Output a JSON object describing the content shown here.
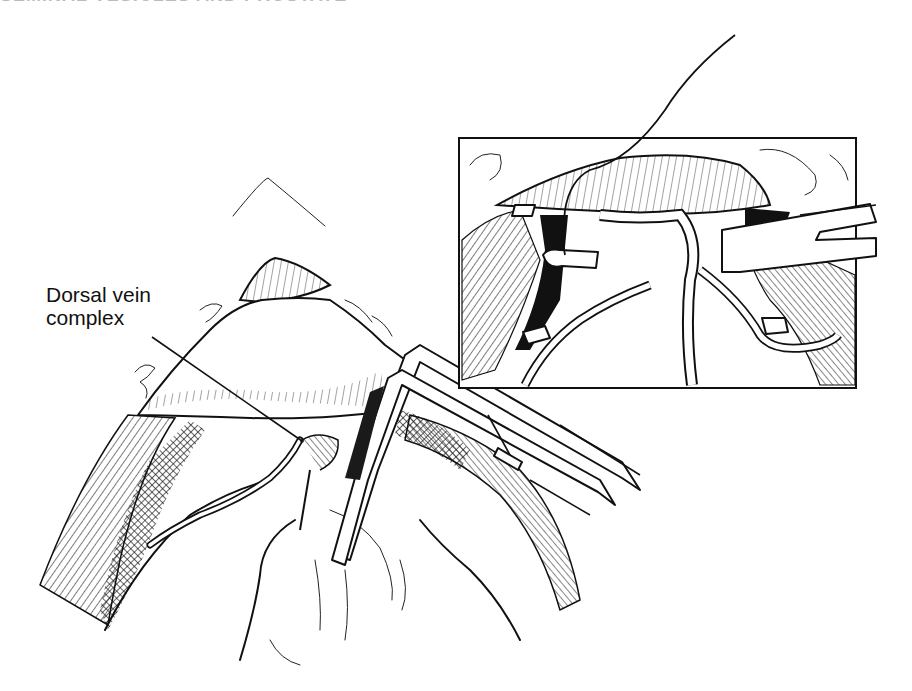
{
  "header": {
    "text_fragment": "SEMINAL VESICLES AND PROSTATE"
  },
  "figure": {
    "labels": [
      {
        "id": "dorsal-vein-complex",
        "line1": "Dorsal vein",
        "line2": "complex"
      }
    ],
    "inset": {
      "present": true,
      "description": "Close-up of ligature passed around dorsal vein complex with clamp"
    },
    "colors": {
      "ink": "#111111",
      "background": "#ffffff"
    }
  }
}
